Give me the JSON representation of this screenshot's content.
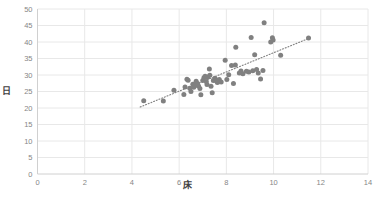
{
  "chart_data": {
    "type": "scatter",
    "title": "",
    "xlabel": "床",
    "ylabel": "日",
    "xlim": [
      0,
      14
    ],
    "ylim": [
      0,
      50
    ],
    "xticks": [
      0,
      2,
      4,
      6,
      8,
      10,
      12,
      14
    ],
    "yticks": [
      0,
      5,
      10,
      15,
      20,
      25,
      30,
      35,
      40,
      45,
      50
    ],
    "grid": "horizontal-and-vertical",
    "legend": "none",
    "marker_color": "#808080",
    "grid_color": "#E8E8E8",
    "axis_color": "#D0D0D0",
    "tick_label_color": "#868686",
    "trendline": {
      "type": "linear-dotted",
      "color": "#7F7F7F",
      "x_start": 4.35,
      "y_start": 20.3,
      "x_end": 11.6,
      "y_end": 41.4
    },
    "points": [
      [
        4.5,
        22.2
      ],
      [
        5.33,
        22.1
      ],
      [
        5.78,
        25.4
      ],
      [
        6.2,
        24.1
      ],
      [
        6.25,
        26.4
      ],
      [
        6.33,
        28.7
      ],
      [
        6.38,
        28.4
      ],
      [
        6.45,
        26.0
      ],
      [
        6.5,
        25.0
      ],
      [
        6.58,
        27.2
      ],
      [
        6.62,
        26.3
      ],
      [
        6.7,
        26.9
      ],
      [
        6.72,
        28.1
      ],
      [
        6.78,
        27.4
      ],
      [
        6.82,
        26.7
      ],
      [
        6.88,
        25.9
      ],
      [
        6.92,
        24.0
      ],
      [
        7.0,
        28.3
      ],
      [
        7.05,
        29.2
      ],
      [
        7.1,
        29.6
      ],
      [
        7.15,
        28.0
      ],
      [
        7.18,
        27.1
      ],
      [
        7.22,
        29.4
      ],
      [
        7.28,
        31.8
      ],
      [
        7.3,
        29.9
      ],
      [
        7.35,
        26.6
      ],
      [
        7.4,
        24.6
      ],
      [
        7.45,
        28.3
      ],
      [
        7.52,
        29.0
      ],
      [
        7.58,
        28.2
      ],
      [
        7.62,
        27.7
      ],
      [
        7.7,
        28.6
      ],
      [
        7.78,
        27.9
      ],
      [
        7.95,
        34.5
      ],
      [
        8.02,
        28.6
      ],
      [
        8.1,
        30.1
      ],
      [
        8.22,
        32.9
      ],
      [
        8.3,
        27.4
      ],
      [
        8.38,
        33.0
      ],
      [
        8.4,
        38.4
      ],
      [
        8.55,
        30.6
      ],
      [
        8.62,
        31.2
      ],
      [
        8.7,
        30.4
      ],
      [
        8.85,
        31.1
      ],
      [
        8.95,
        30.9
      ],
      [
        9.05,
        41.4
      ],
      [
        9.12,
        31.3
      ],
      [
        9.2,
        36.1
      ],
      [
        9.28,
        31.7
      ],
      [
        9.35,
        30.6
      ],
      [
        9.45,
        28.8
      ],
      [
        9.55,
        31.4
      ],
      [
        9.6,
        45.8
      ],
      [
        9.88,
        40.0
      ],
      [
        9.95,
        41.3
      ],
      [
        9.98,
        40.6
      ],
      [
        10.3,
        36.0
      ],
      [
        11.48,
        41.2
      ]
    ]
  }
}
